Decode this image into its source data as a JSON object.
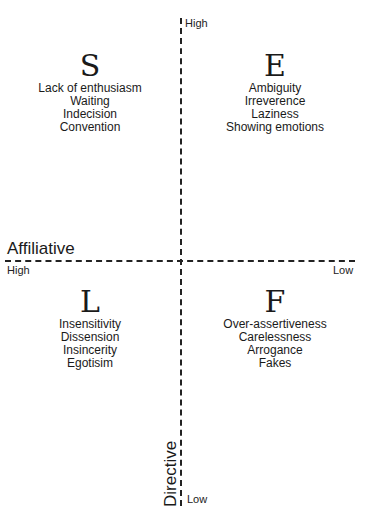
{
  "diagram": {
    "top_title_cutoff": "",
    "vertical_axis": {
      "label": "Directive",
      "high_label": "High",
      "low_label": "Low"
    },
    "horizontal_axis": {
      "label": "Affiliative",
      "high_label": "High",
      "low_label": "Low"
    },
    "quadrants": [
      {
        "position": "top-left",
        "letter": "S",
        "items": [
          "Lack of enthusiasm",
          "Waiting",
          "Indecision",
          "Convention"
        ]
      },
      {
        "position": "top-right",
        "letter": "E",
        "items": [
          "Ambiguity",
          "Irreverence",
          "Laziness",
          "Showing emotions"
        ]
      },
      {
        "position": "bottom-left",
        "letter": "L",
        "items": [
          "Insensitivity",
          "Dissension",
          "Insincerity",
          "Egotisim"
        ]
      },
      {
        "position": "bottom-right",
        "letter": "F",
        "items": [
          "Over-assertiveness",
          "Carelessness",
          "Arrogance",
          "Fakes"
        ]
      }
    ],
    "colors": {
      "line": "#222222",
      "text": "#1a1a1a",
      "background": "#ffffff"
    }
  }
}
